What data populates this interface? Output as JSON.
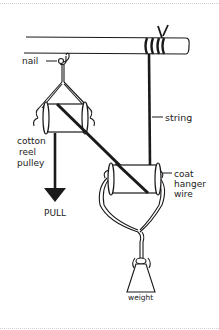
{
  "diagram": {
    "title": "",
    "labels": {
      "nail": "nail",
      "string": "string",
      "cotton_reel_line1": "cotton",
      "cotton_reel_line2": "reel",
      "cotton_reel_line3": "pulley",
      "coat_hanger_line1": "coat",
      "coat_hanger_line2": "hanger",
      "coat_hanger_line3": "wire",
      "pull": "PULL",
      "weight": "weight"
    },
    "components": [
      "rod",
      "nail",
      "string",
      "cotton reel pulley (fixed)",
      "cotton reel pulley (movable)",
      "coat hanger wire",
      "weight"
    ],
    "colors": {
      "ink": "#1a1a1a",
      "background": "#ffffff",
      "border": "#cfcfcf"
    }
  }
}
